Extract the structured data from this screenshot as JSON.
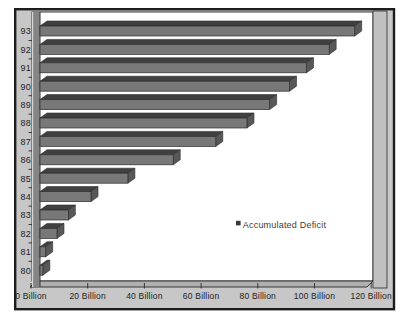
{
  "panel": {
    "background": "#c7c7c7",
    "border_color": "#1d1d1d",
    "plot_background": "#ffffff"
  },
  "chart_data": {
    "type": "bar",
    "orientation": "horizontal",
    "unit": "Billion",
    "categories": [
      "93",
      "92",
      "91",
      "90",
      "89",
      "88",
      "87",
      "86",
      "85",
      "84",
      "83",
      "82",
      "81",
      "80"
    ],
    "series": [
      {
        "name": "Accumulated Deficit",
        "values": [
          111,
          102,
          94,
          88,
          81,
          73,
          62,
          47,
          31,
          18,
          10,
          6,
          2,
          1
        ]
      }
    ],
    "x_ticks": [
      "0 Billion",
      "20 Billion",
      "40 Billion",
      "60 Billion",
      "80 Billion",
      "100 Billion",
      "120 Billion"
    ],
    "xlim": [
      0,
      120
    ],
    "grid": false,
    "legend": {
      "marker": "square",
      "label": "Accumulated Deficit",
      "position": "center-right"
    },
    "colors": {
      "bar_front": "#787878",
      "bar_top": "#404040",
      "bar_end": "#585858",
      "bar_outline": "#2c2c2c",
      "axis_column_face": "#858585",
      "axis_column_highlight": "#d6d6d6",
      "axis_column_edge": "#373737",
      "floor": "#b0b0b0",
      "side_wall": "#c0c0c0",
      "axis_line": "#2b2b2b",
      "legend_marker": "#3a3a3a"
    }
  }
}
